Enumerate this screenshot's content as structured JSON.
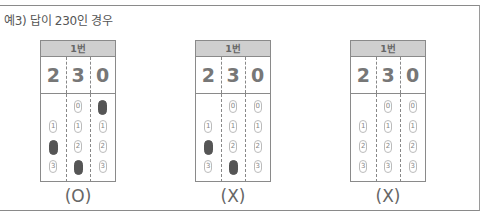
{
  "title": "예3) 답이 230인 경우",
  "cards": [
    {
      "header": "1번",
      "digits": [
        "2",
        "3",
        "0"
      ],
      "columns": [
        [
          {
            "label": "",
            "state": "empty"
          },
          {
            "label": "1",
            "state": "open"
          },
          {
            "label": "2",
            "state": "filled"
          },
          {
            "label": "3",
            "state": "open"
          }
        ],
        [
          {
            "label": "0",
            "state": "open"
          },
          {
            "label": "1",
            "state": "open"
          },
          {
            "label": "2",
            "state": "open"
          },
          {
            "label": "3",
            "state": "filled"
          }
        ],
        [
          {
            "label": "0",
            "state": "filled"
          },
          {
            "label": "1",
            "state": "open"
          },
          {
            "label": "2",
            "state": "open"
          },
          {
            "label": "3",
            "state": "open"
          }
        ]
      ],
      "verdict": "(O)"
    },
    {
      "header": "1번",
      "digits": [
        "2",
        "3",
        "0"
      ],
      "columns": [
        [
          {
            "label": "",
            "state": "empty"
          },
          {
            "label": "1",
            "state": "open"
          },
          {
            "label": "2",
            "state": "filled"
          },
          {
            "label": "3",
            "state": "open"
          }
        ],
        [
          {
            "label": "0",
            "state": "open"
          },
          {
            "label": "1",
            "state": "open"
          },
          {
            "label": "2",
            "state": "open"
          },
          {
            "label": "3",
            "state": "filled"
          }
        ],
        [
          {
            "label": "0",
            "state": "open"
          },
          {
            "label": "1",
            "state": "open"
          },
          {
            "label": "2",
            "state": "open"
          },
          {
            "label": "3",
            "state": "open"
          }
        ]
      ],
      "verdict": "(X)"
    },
    {
      "header": "1번",
      "digits": [
        "2",
        "3",
        "0"
      ],
      "columns": [
        [
          {
            "label": "",
            "state": "empty"
          },
          {
            "label": "1",
            "state": "open"
          },
          {
            "label": "2",
            "state": "open"
          },
          {
            "label": "3",
            "state": "open"
          }
        ],
        [
          {
            "label": "0",
            "state": "open"
          },
          {
            "label": "1",
            "state": "open"
          },
          {
            "label": "2",
            "state": "open"
          },
          {
            "label": "3",
            "state": "open"
          }
        ],
        [
          {
            "label": "0",
            "state": "open"
          },
          {
            "label": "1",
            "state": "open"
          },
          {
            "label": "2",
            "state": "open"
          },
          {
            "label": "3",
            "state": "open"
          }
        ]
      ],
      "verdict": "(X)"
    }
  ]
}
